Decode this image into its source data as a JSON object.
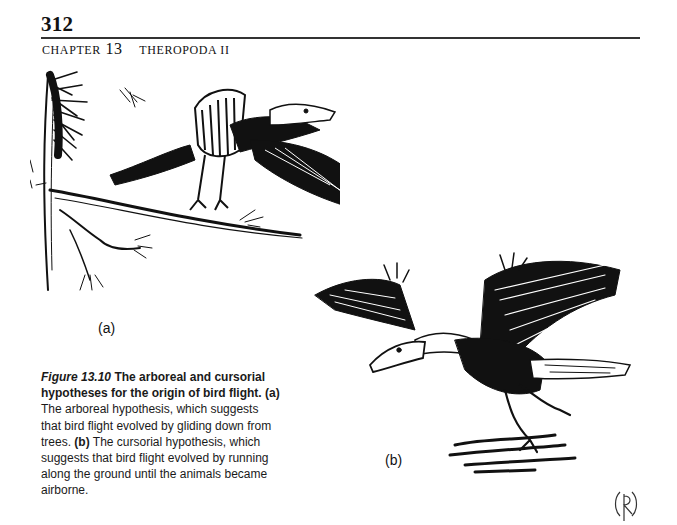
{
  "header": {
    "page_number": "312",
    "chapter_label": "Chapter",
    "chapter_number": "13",
    "chapter_title": "Theropoda II"
  },
  "figure": {
    "panels": [
      {
        "id": "a",
        "label": "(a)",
        "depicts": "Feathered theropod perched on a pine branch, wings spread (arboreal hypothesis)"
      },
      {
        "id": "b",
        "label": "(b)",
        "depicts": "Feathered theropod running along the ground with wings raised (cursorial hypothesis)"
      }
    ],
    "caption": {
      "number": "Figure 13.10",
      "title": "The arboreal and cursorial hypotheses for the origin of bird flight.",
      "part_a_label": "(a)",
      "part_a_text": "The arboreal hypothesis, which suggests that bird flight evolved by gliding down from trees.",
      "part_b_label": "(b)",
      "part_b_text": "The cursorial hypothesis, which suggests that bird flight evolved by running along the ground until the animals became airborne."
    },
    "artist_signature": "R"
  }
}
